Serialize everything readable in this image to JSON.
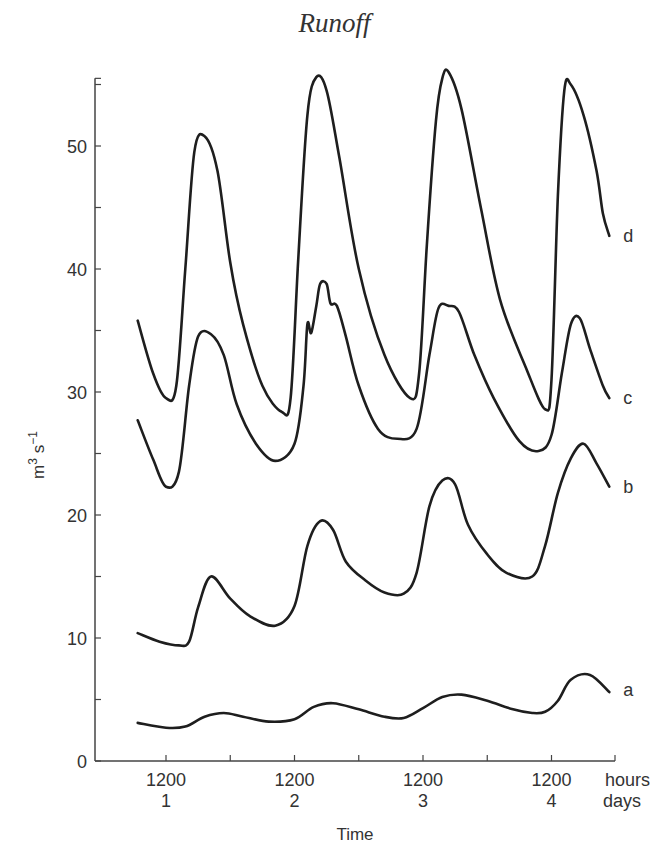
{
  "title": "Runoff",
  "chart_data": {
    "type": "line",
    "title": "Runoff",
    "xlabel": "Time",
    "ylabel": "m³ s⁻¹",
    "ylim": [
      0,
      55
    ],
    "yticks": [
      0,
      10,
      20,
      30,
      40,
      50
    ],
    "x_unit_labels": [
      "hours",
      "days"
    ],
    "xticks": [
      {
        "hour": "1200",
        "day": "1"
      },
      {
        "hour": "1200",
        "day": "2"
      },
      {
        "hour": "1200",
        "day": "3"
      },
      {
        "hour": "1200",
        "day": "4"
      }
    ],
    "xlim_days": [
      0.78,
      4.5
    ],
    "grid": false,
    "legend": "inline labels at right end of each curve",
    "series": [
      {
        "name": "a",
        "x": [
          0.78,
          1.0,
          1.15,
          1.3,
          1.45,
          1.6,
          1.8,
          2.0,
          2.15,
          2.3,
          2.5,
          2.7,
          2.85,
          3.0,
          3.15,
          3.3,
          3.5,
          3.7,
          3.85,
          3.95,
          4.05,
          4.15,
          4.3,
          4.45
        ],
        "y": [
          3.1,
          2.7,
          2.8,
          3.6,
          3.9,
          3.6,
          3.2,
          3.4,
          4.4,
          4.7,
          4.2,
          3.6,
          3.5,
          4.3,
          5.2,
          5.4,
          4.9,
          4.2,
          3.9,
          4.0,
          4.9,
          6.6,
          7.0,
          5.6
        ]
      },
      {
        "name": "b",
        "x": [
          0.78,
          0.95,
          1.1,
          1.18,
          1.25,
          1.35,
          1.5,
          1.65,
          1.85,
          2.0,
          2.1,
          2.2,
          2.3,
          2.4,
          2.55,
          2.7,
          2.85,
          2.95,
          3.05,
          3.15,
          3.25,
          3.35,
          3.5,
          3.65,
          3.85,
          3.95,
          4.05,
          4.15,
          4.25,
          4.35,
          4.45
        ],
        "y": [
          10.4,
          9.7,
          9.4,
          9.7,
          12.5,
          15.0,
          13.2,
          11.8,
          11.0,
          12.6,
          17.5,
          19.5,
          18.8,
          16.2,
          14.7,
          13.7,
          13.6,
          15.3,
          20.7,
          22.8,
          22.5,
          19.2,
          16.8,
          15.3,
          15.0,
          17.5,
          21.8,
          24.6,
          25.8,
          24.2,
          22.3
        ]
      },
      {
        "name": "c",
        "x": [
          0.78,
          0.9,
          1.0,
          1.1,
          1.18,
          1.25,
          1.35,
          1.45,
          1.55,
          1.7,
          1.85,
          2.0,
          2.07,
          2.1,
          2.13,
          2.17,
          2.2,
          2.25,
          2.28,
          2.33,
          2.4,
          2.5,
          2.65,
          2.8,
          2.95,
          3.05,
          3.12,
          3.2,
          3.28,
          3.4,
          3.55,
          3.75,
          3.9,
          4.0,
          4.08,
          4.15,
          4.22,
          4.3,
          4.4,
          4.45
        ],
        "y": [
          27.7,
          24.5,
          22.3,
          23.5,
          30.5,
          34.5,
          34.7,
          33.0,
          29.0,
          25.8,
          24.4,
          25.8,
          30.5,
          35.5,
          34.8,
          37.0,
          38.8,
          38.8,
          37.2,
          37.0,
          34.5,
          30.5,
          27.0,
          26.2,
          27.0,
          33.0,
          36.8,
          37.0,
          36.5,
          33.0,
          29.5,
          26.0,
          25.2,
          26.5,
          31.5,
          35.5,
          36.0,
          33.5,
          30.5,
          29.5
        ]
      },
      {
        "name": "d",
        "x": [
          0.78,
          0.9,
          1.0,
          1.08,
          1.15,
          1.22,
          1.3,
          1.4,
          1.5,
          1.6,
          1.75,
          1.9,
          1.97,
          2.03,
          2.1,
          2.17,
          2.25,
          2.35,
          2.5,
          2.7,
          2.9,
          2.97,
          3.03,
          3.1,
          3.15,
          3.2,
          3.3,
          3.45,
          3.6,
          3.8,
          3.95,
          4.0,
          4.05,
          4.1,
          4.15,
          4.25,
          4.35,
          4.4,
          4.45
        ],
        "y": [
          35.8,
          31.5,
          29.5,
          30.5,
          40.0,
          49.5,
          50.8,
          48.0,
          40.5,
          35.5,
          30.5,
          28.4,
          29.5,
          41.0,
          52.5,
          55.6,
          54.5,
          49.0,
          40.0,
          33.0,
          29.5,
          31.5,
          42.0,
          52.0,
          55.5,
          56.0,
          53.0,
          45.0,
          37.5,
          32.0,
          28.6,
          31.0,
          46.0,
          54.5,
          55.0,
          52.5,
          48.0,
          44.5,
          42.7
        ]
      }
    ]
  },
  "axis": {
    "ylabel_base": "m",
    "ylabel_sup1": "3",
    "ylabel_mid": " s",
    "ylabel_sup2": "−1",
    "xlabel": "Time",
    "hours_label": "hours",
    "days_label": "days"
  }
}
